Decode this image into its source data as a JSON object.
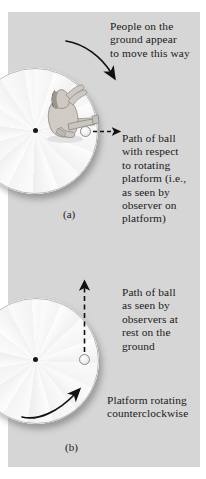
{
  "figure": {
    "background_color": "#d6d6d6",
    "panels": [
      {
        "id": "a",
        "label": "(a)",
        "annotations": {
          "rotation_note": "People on the\nground appear\nto move this way",
          "path_note": "Path of ball\nwith respect\nto rotating\nplatform (i.e.,\nas seen by\nobserver on\nplatform)"
        },
        "elements": {
          "platform": "rotating-platform-disc",
          "person": "seated-person-throwing-ball",
          "ball": "ball",
          "ball_path": "curved-dashed-path-arrow",
          "motion_arrow": "curved-arrow-clockwise-apparent"
        }
      },
      {
        "id": "b",
        "label": "(b)",
        "annotations": {
          "path_note": "Path of ball\nas seen by\nobservers at\nrest on the\nground",
          "rotation_note": "Platform rotating\ncounterclockwise"
        },
        "elements": {
          "platform": "rotating-platform-disc",
          "ball": "ball",
          "ball_path": "straight-dashed-path-arrow",
          "motion_arrow": "curved-arrow-counterclockwise"
        }
      }
    ]
  },
  "text": {
    "panel_a": {
      "rotation_line1": "People on the",
      "rotation_line2": "ground appear",
      "rotation_line3": "to move this way",
      "path_line1": "Path of ball",
      "path_line2": "with respect",
      "path_line3": "to rotating",
      "path_line4": "platform (i.e.,",
      "path_line5": "as seen by",
      "path_line6": "observer on",
      "path_line7": "platform)",
      "label": "(a)"
    },
    "panel_b": {
      "path_line1": "Path of ball",
      "path_line2": "as seen by",
      "path_line3": "observers at",
      "path_line4": "rest on the",
      "path_line5": "ground",
      "rotation_line1": "Platform rotating",
      "rotation_line2": "counterclockwise",
      "label": "(b)"
    }
  },
  "colors": {
    "background": "#d6d6d6",
    "disc": "#fcfcfc",
    "ink": "#1a1a1a",
    "rim": "#b9b9b9"
  }
}
